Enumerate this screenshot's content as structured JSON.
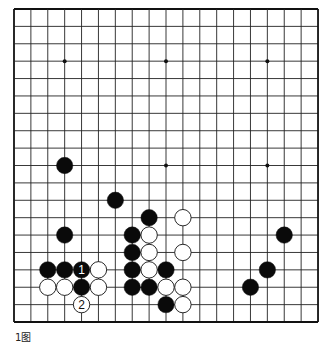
{
  "board": {
    "size": 19,
    "origin": [
      14,
      9
    ],
    "spacing": [
      16.89,
      17.39
    ],
    "line_color": "#222222",
    "edge_color": "#111111",
    "background": "#ffffff",
    "stone_radius": 8.2,
    "star_points": [
      [
        3,
        3
      ],
      [
        9,
        3
      ],
      [
        15,
        3
      ],
      [
        3,
        9
      ],
      [
        9,
        9
      ],
      [
        15,
        9
      ],
      [
        3,
        15
      ],
      [
        9,
        15
      ],
      [
        15,
        15
      ]
    ],
    "stones": [
      {
        "color": "black",
        "col": 3,
        "row": 9
      },
      {
        "color": "black",
        "col": 6,
        "row": 11
      },
      {
        "color": "black",
        "col": 8,
        "row": 12
      },
      {
        "color": "white",
        "col": 10,
        "row": 12
      },
      {
        "color": "black",
        "col": 3,
        "row": 13
      },
      {
        "color": "black",
        "col": 7,
        "row": 13
      },
      {
        "color": "white",
        "col": 8,
        "row": 13
      },
      {
        "color": "black",
        "col": 16,
        "row": 13
      },
      {
        "color": "black",
        "col": 7,
        "row": 14
      },
      {
        "color": "white",
        "col": 8,
        "row": 14
      },
      {
        "color": "white",
        "col": 10,
        "row": 14
      },
      {
        "color": "black",
        "col": 2,
        "row": 15
      },
      {
        "color": "black",
        "col": 3,
        "row": 15
      },
      {
        "color": "black",
        "col": 4,
        "row": 15,
        "label": "1"
      },
      {
        "color": "white",
        "col": 5,
        "row": 15
      },
      {
        "color": "black",
        "col": 7,
        "row": 15
      },
      {
        "color": "white",
        "col": 8,
        "row": 15
      },
      {
        "color": "black",
        "col": 9,
        "row": 15
      },
      {
        "color": "black",
        "col": 15,
        "row": 15
      },
      {
        "color": "white",
        "col": 2,
        "row": 16
      },
      {
        "color": "white",
        "col": 3,
        "row": 16
      },
      {
        "color": "black",
        "col": 4,
        "row": 16
      },
      {
        "color": "white",
        "col": 5,
        "row": 16
      },
      {
        "color": "black",
        "col": 7,
        "row": 16
      },
      {
        "color": "black",
        "col": 8,
        "row": 16
      },
      {
        "color": "white",
        "col": 9,
        "row": 16
      },
      {
        "color": "white",
        "col": 10,
        "row": 16
      },
      {
        "color": "black",
        "col": 14,
        "row": 16
      },
      {
        "color": "white",
        "col": 4,
        "row": 17,
        "label": "2"
      },
      {
        "color": "black",
        "col": 9,
        "row": 17
      },
      {
        "color": "white",
        "col": 10,
        "row": 17
      }
    ]
  },
  "caption": "1图"
}
